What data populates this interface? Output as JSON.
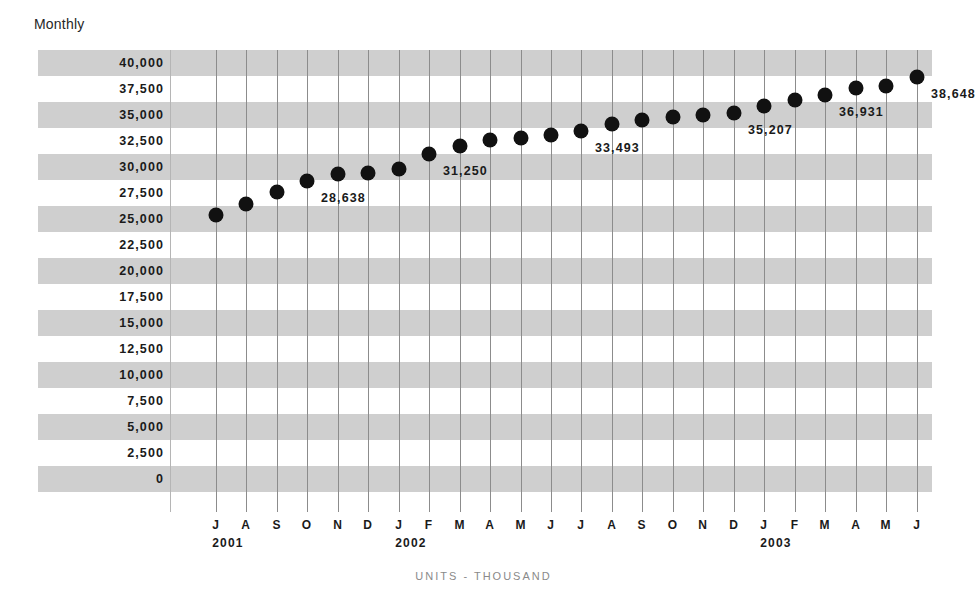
{
  "chart_data": {
    "type": "scatter",
    "title": "Monthly",
    "xlabel": "",
    "ylabel": "",
    "footer_note": "UNITS - THOUSAND",
    "ylim": [
      0,
      40000
    ],
    "ytick_step": 2500,
    "ytick_labels": [
      "40,000",
      "37,500",
      "35,000",
      "32,500",
      "30,000",
      "27,500",
      "25,000",
      "22,500",
      "20,000",
      "17,500",
      "15,000",
      "12,500",
      "10,000",
      "7,500",
      "5,000",
      "2,500",
      "0"
    ],
    "ytick_values": [
      40000,
      37500,
      35000,
      32500,
      30000,
      27500,
      25000,
      22500,
      20000,
      17500,
      15000,
      12500,
      10000,
      7500,
      5000,
      2500,
      0
    ],
    "grid": "horizontal-bands-and-vertical-lines",
    "legend": "none",
    "x_month_labels": [
      "J",
      "A",
      "S",
      "O",
      "N",
      "D",
      "J",
      "F",
      "M",
      "A",
      "M",
      "J",
      "J",
      "A",
      "S",
      "O",
      "N",
      "D",
      "J",
      "F",
      "M",
      "A",
      "M",
      "J"
    ],
    "x_year_labels": [
      {
        "label": "2001",
        "index": 0
      },
      {
        "label": "2002",
        "index": 6
      },
      {
        "label": "2003",
        "index": 18
      }
    ],
    "categories": [
      "J 2001",
      "A 2001",
      "S 2001",
      "O 2001",
      "N 2001",
      "D 2001",
      "J 2002",
      "F 2002",
      "M 2002",
      "A 2002",
      "M 2002",
      "J 2002",
      "J 2002",
      "A 2002",
      "S 2002",
      "O 2002",
      "N 2002",
      "D 2002",
      "J 2003",
      "F 2003",
      "M 2003",
      "A 2003",
      "M 2003",
      "J 2003"
    ],
    "values": [
      25400,
      26400,
      27600,
      28638,
      29300,
      29400,
      29800,
      31250,
      32000,
      32600,
      32800,
      33100,
      33493,
      34100,
      34500,
      34800,
      35000,
      35207,
      35900,
      36400,
      36931,
      37600,
      37800,
      38648
    ],
    "annotations": [
      {
        "index": 3,
        "text": "28,638",
        "value": 28638
      },
      {
        "index": 7,
        "text": "31,250",
        "value": 31250
      },
      {
        "index": 12,
        "text": "33,493",
        "value": 33493
      },
      {
        "index": 17,
        "text": "35,207",
        "value": 35207
      },
      {
        "index": 20,
        "text": "36,931",
        "value": 36931
      },
      {
        "index": 23,
        "text": "38,648",
        "value": 38648
      }
    ],
    "colors": {
      "marker": "#111111",
      "band": "#cfcfcf",
      "gridline": "#8c8c8c",
      "text": "#1a1a1a",
      "footer_text": "#8a8a8a",
      "background": "#ffffff"
    }
  }
}
